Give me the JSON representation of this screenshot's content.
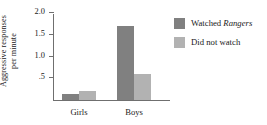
{
  "chart_data": {
    "type": "bar",
    "title": "",
    "xlabel": "",
    "ylabel_line1": "Aggressive responses",
    "ylabel_line2": "per minute",
    "categories": [
      "Girls",
      "Boys"
    ],
    "series": [
      {
        "name": "Watched Rangers",
        "name_plain": "Watched ",
        "name_emph": "Rangers",
        "color": "#808080",
        "values": [
          0.13,
          1.7
        ]
      },
      {
        "name": "Did not watch",
        "name_plain": "Did not watch",
        "name_emph": "",
        "color": "#b2b2b2",
        "values": [
          0.2,
          0.6
        ]
      }
    ],
    "ylim": [
      0,
      2.0
    ],
    "yticks": [
      2.0,
      1.5,
      1.0,
      0.5
    ],
    "ytick_labels": [
      "2.0",
      "1.5",
      "1.0",
      ".5"
    ],
    "grid": false,
    "legend_position": "right"
  },
  "legend": {
    "items": [
      {
        "prefix": "Watched ",
        "emph": "Rangers"
      },
      {
        "prefix": "Did not watch",
        "emph": ""
      }
    ]
  }
}
